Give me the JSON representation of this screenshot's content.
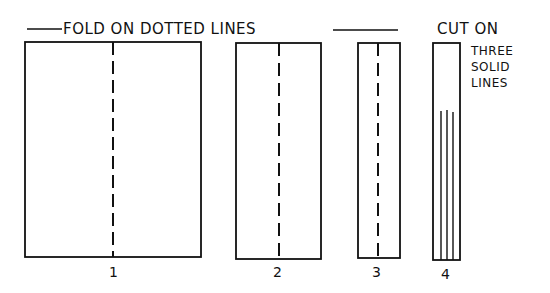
{
  "title": "FOLD ON DOTTED LINES",
  "cut_instruction": {
    "line1": "CUT ON",
    "line2": "THREE",
    "line3": "SOLID",
    "line4": "LINES"
  },
  "panels": [
    {
      "label": "1",
      "fold": "dashed center line"
    },
    {
      "label": "2",
      "fold": "dashed center line"
    },
    {
      "label": "3",
      "fold": "dashed center line"
    },
    {
      "label": "4",
      "cut": "three solid lines"
    }
  ],
  "colors": {
    "ink": "#111111",
    "paper": "#ffffff"
  }
}
